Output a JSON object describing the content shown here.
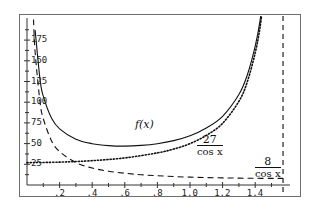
{
  "chart_data": {
    "type": "line",
    "title": "",
    "xlabel": "",
    "ylabel": "",
    "xlim": [
      0,
      1.62
    ],
    "ylim": [
      0,
      205
    ],
    "grid": false,
    "x_tick_labels": [
      ".2",
      ".4",
      ".6",
      ".8",
      "1.0",
      "1.2",
      "1.4"
    ],
    "x_ticks": [
      0.2,
      0.4,
      0.6,
      0.8,
      1.0,
      1.2,
      1.4
    ],
    "y_tick_labels": [
      "25",
      "50",
      "75",
      "100",
      "125",
      "150",
      "175"
    ],
    "y_ticks": [
      25,
      50,
      75,
      100,
      125,
      150,
      175
    ],
    "vertical_asymptote_x": 1.5708,
    "series": [
      {
        "name": "f(x)",
        "style": "solid",
        "x": [
          0.05,
          0.08,
          0.1,
          0.15,
          0.2,
          0.3,
          0.4,
          0.5,
          0.6,
          0.7,
          0.8,
          0.9,
          1.0,
          1.1,
          1.2,
          1.3,
          1.35,
          1.4,
          1.43,
          1.45
        ],
        "y": [
          187.1,
          127.2,
          107.3,
          80.8,
          67.8,
          55.3,
          49.9,
          47.5,
          46.9,
          47.8,
          49.9,
          53.6,
          59.5,
          68.9,
          83.0,
          109.3,
          131.9,
          167.7,
          198.9,
          231.8
        ]
      },
      {
        "name": "27/cos x",
        "style": "dotted",
        "x": [
          0.0,
          0.2,
          0.4,
          0.6,
          0.8,
          0.9,
          1.0,
          1.1,
          1.2,
          1.3,
          1.35,
          1.4,
          1.43,
          1.45
        ],
        "y": [
          27.0,
          27.6,
          29.4,
          32.7,
          38.8,
          43.4,
          50.0,
          59.9,
          74.5,
          101.0,
          123.7,
          159.6,
          190.8,
          223.7
        ]
      },
      {
        "name": "8/cos x",
        "style": "dashed",
        "x": [
          0.04,
          0.05,
          0.08,
          0.1,
          0.15,
          0.2,
          0.3,
          0.4,
          0.5,
          0.6,
          0.7,
          0.8,
          0.9,
          1.0,
          1.1,
          1.2,
          1.3,
          1.4,
          1.5,
          1.57
        ],
        "y": [
          200.0,
          160.1,
          100.1,
          80.1,
          53.5,
          40.3,
          27.1,
          20.5,
          16.7,
          14.2,
          12.4,
          11.2,
          10.2,
          9.5,
          9.0,
          8.6,
          8.3,
          8.1,
          8.0,
          8.0
        ]
      }
    ],
    "annotations": [
      {
        "text": "f(x)",
        "x": 0.78,
        "y": 72
      },
      {
        "text_num": "27",
        "text_den": "cos x",
        "x": 1.12,
        "y": 40
      },
      {
        "text_num": "8",
        "text_den": "cos x",
        "x": 1.43,
        "y": 26
      }
    ]
  },
  "labels": {
    "f": "f(x)",
    "f27_num": "27",
    "f27_den": "cos x",
    "f8_num": "8",
    "f8_den": "cos x"
  }
}
